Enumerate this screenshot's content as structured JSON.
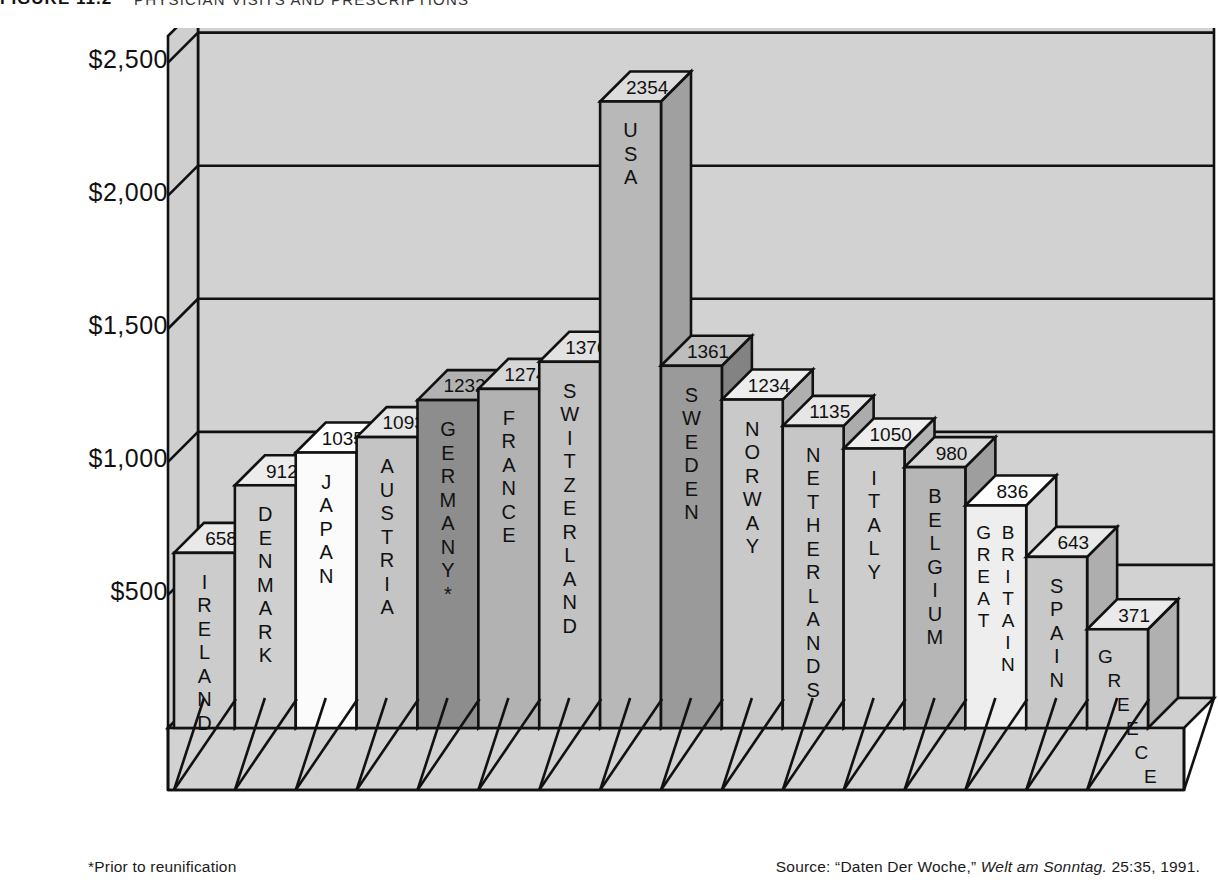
{
  "figure": {
    "label": "FIGURE 11.2",
    "title": "PHYSICIAN VISITS AND PRESCRIPTIONS"
  },
  "footer": {
    "footnote": "*Prior to reunification",
    "source_prefix": "Source: “Daten Der Woche,” ",
    "source_italic": "Welt am Sonntag.",
    "source_suffix": " 25:35, 1991."
  },
  "axis": {
    "ticks": [
      "$2,500",
      "$2,000",
      "$1,500",
      "$1,000",
      "$500"
    ],
    "tick_values": [
      2500,
      2000,
      1500,
      1000,
      500
    ]
  },
  "colors": {
    "background": "#d6d6d6",
    "wall": "#d2d2d2",
    "floor": "#d0d0d0",
    "line": "#111111",
    "text": "#111111"
  },
  "chart_data": {
    "type": "bar",
    "title": "PHYSICIAN VISITS AND PRESCRIPTIONS",
    "xlabel": "",
    "ylabel": "",
    "ylim": [
      0,
      2600
    ],
    "grid": true,
    "legend": "none",
    "units": "US dollars per capita",
    "categories": [
      "IRELAND",
      "DENMARK",
      "JAPAN",
      "AUSTRIA",
      "GERMANY*",
      "FRANCE",
      "SWITZERLAND",
      "USA",
      "SWEDEN",
      "NORWAY",
      "NETHERLANDS",
      "ITALY",
      "BELGIUM",
      "GREAT BRITAIN",
      "SPAIN",
      "GREECE"
    ],
    "values": [
      658,
      912,
      1035,
      1093,
      1232,
      1274,
      1376,
      2354,
      1361,
      1234,
      1135,
      1050,
      980,
      836,
      643,
      371
    ],
    "bars": [
      {
        "label": "IRELAND",
        "value": 658,
        "label_display": "IRELAND",
        "color": "#cccccc",
        "top_color": "#e9e9e9",
        "side_color": "#b4b4b4"
      },
      {
        "label": "DENMARK",
        "value": 912,
        "label_display": "DENMARK",
        "color": "#cfcfcf",
        "top_color": "#ececec",
        "side_color": "#b6b6b6"
      },
      {
        "label": "JAPAN",
        "value": 1035,
        "label_display": "JAPAN",
        "color": "#fbfbfb",
        "top_color": "#ffffff",
        "side_color": "#e2e2e2"
      },
      {
        "label": "AUSTRIA",
        "value": 1093,
        "label_display": "AUSTRIA",
        "color": "#c4c4c4",
        "top_color": "#e4e4e4",
        "side_color": "#ababab"
      },
      {
        "label": "GERMANY*",
        "value": 1232,
        "label_display": "GERMANY*",
        "color": "#8d8d8d",
        "top_color": "#b2b2b2",
        "side_color": "#777777"
      },
      {
        "label": "FRANCE",
        "value": 1274,
        "label_display": "FRANCE",
        "color": "#b2b2b2",
        "top_color": "#d6d6d6",
        "side_color": "#9b9b9b"
      },
      {
        "label": "SWITZERLAND",
        "value": 1376,
        "label_display": "SWITZERLAND",
        "color": "#c2c2c2",
        "top_color": "#e2e2e2",
        "side_color": "#a8a8a8"
      },
      {
        "label": "USA",
        "value": 2354,
        "label_display": "USA",
        "color": "#b8b8b8",
        "top_color": "#dcdcdc",
        "side_color": "#a0a0a0"
      },
      {
        "label": "SWEDEN",
        "value": 1361,
        "label_display": "SWEDEN",
        "color": "#9a9a9a",
        "top_color": "#bdbdbd",
        "side_color": "#838383"
      },
      {
        "label": "NORWAY",
        "value": 1234,
        "label_display": "NORWAY",
        "color": "#c9c9c9",
        "top_color": "#ededed",
        "side_color": "#afafaf"
      },
      {
        "label": "NETHERLANDS",
        "value": 1135,
        "label_display": "NETHERLANDS",
        "color": "#c6c6c6",
        "top_color": "#e6e6e6",
        "side_color": "#acacac"
      },
      {
        "label": "ITALY",
        "value": 1050,
        "label_display": "ITALY",
        "color": "#cdcdcd",
        "top_color": "#ededed",
        "side_color": "#b3b3b3"
      },
      {
        "label": "BELGIUM",
        "value": 980,
        "label_display": "BELGIUM",
        "color": "#b6b6b6",
        "top_color": "#d9d9d9",
        "side_color": "#9e9e9e"
      },
      {
        "label": "GREAT BRITAIN",
        "value": 836,
        "label_display": "GREAT BRITAIN",
        "color": "#eeeeee",
        "top_color": "#fdfdfd",
        "side_color": "#d4d4d4"
      },
      {
        "label": "SPAIN",
        "value": 643,
        "label_display": "SPAIN",
        "color": "#c8c8c8",
        "top_color": "#e9e9e9",
        "side_color": "#aeaeae"
      },
      {
        "label": "GREECE",
        "value": 371,
        "label_display": "GREECE",
        "color": "#cacaca",
        "top_color": "#eaeaea",
        "side_color": "#b0b0b0"
      }
    ]
  }
}
